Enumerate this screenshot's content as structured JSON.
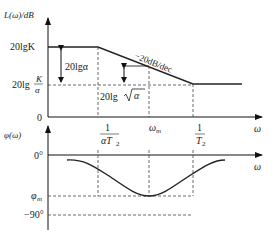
{
  "magnitude_plot": {
    "y_axis_label": "L(ω)/dB",
    "x_axis_label": "ω",
    "origin_label": "0",
    "level_high": "20lgK",
    "level_low_prefix": "20lg",
    "level_low_num": "K",
    "level_low_den": "α",
    "gap_label": "20lgα",
    "slope_label": "−20dB/dec",
    "sqrt_prefix": "20lg",
    "sqrt_arg": "α",
    "break1_num": "1",
    "break1_den": "αT",
    "break1_sub": "2",
    "wm_label": "ω",
    "wm_sub": "m",
    "break2_num": "1",
    "break2_den": "T",
    "break2_sub": "2"
  },
  "phase_plot": {
    "y_axis_label": "φ(ω)",
    "x_axis_label": "ω",
    "zero_label": "0°",
    "phim_label": "φ",
    "phim_sub": "m",
    "minus90_label": "−90°"
  }
}
